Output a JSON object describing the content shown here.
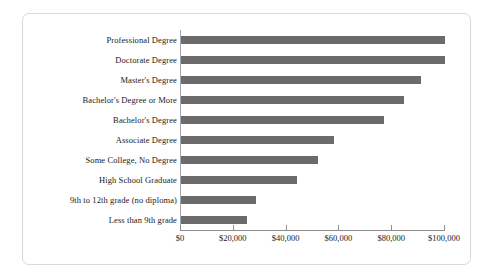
{
  "figure": {
    "frame_color": "#d9d9d9",
    "background": "#ffffff",
    "bar_color": "#6b6b6b",
    "axis_color": "#8f8f8f"
  },
  "chart_data": {
    "type": "bar",
    "orientation": "horizontal",
    "title": "",
    "subtitle": "",
    "xlabel": "",
    "ylabel": "",
    "grid": false,
    "legend": null,
    "xlim": [
      0,
      100000
    ],
    "xtick_values": [
      0,
      20000,
      40000,
      60000,
      80000,
      100000
    ],
    "xtick_labels": [
      "$0",
      "$20,000",
      "$40,000",
      "$60,000",
      "$80,000",
      "$100,000"
    ],
    "categories": [
      "Professional Degree",
      "Doctorate Degree",
      "Master's Degree",
      "Bachelor's Degree or More",
      "Bachelor's Degree",
      "Associate Degree",
      "Some College, No Degree",
      "High School Graduate",
      "9th to 12th grade (no diploma)",
      "Less than 9th grade"
    ],
    "values": [
      100000,
      100000,
      91000,
      84500,
      77000,
      58000,
      52000,
      44000,
      28500,
      25000
    ],
    "series": [
      {
        "name": "Median Earnings",
        "values": [
          100000,
          100000,
          91000,
          84500,
          77000,
          58000,
          52000,
          44000,
          28500,
          25000
        ]
      }
    ]
  }
}
